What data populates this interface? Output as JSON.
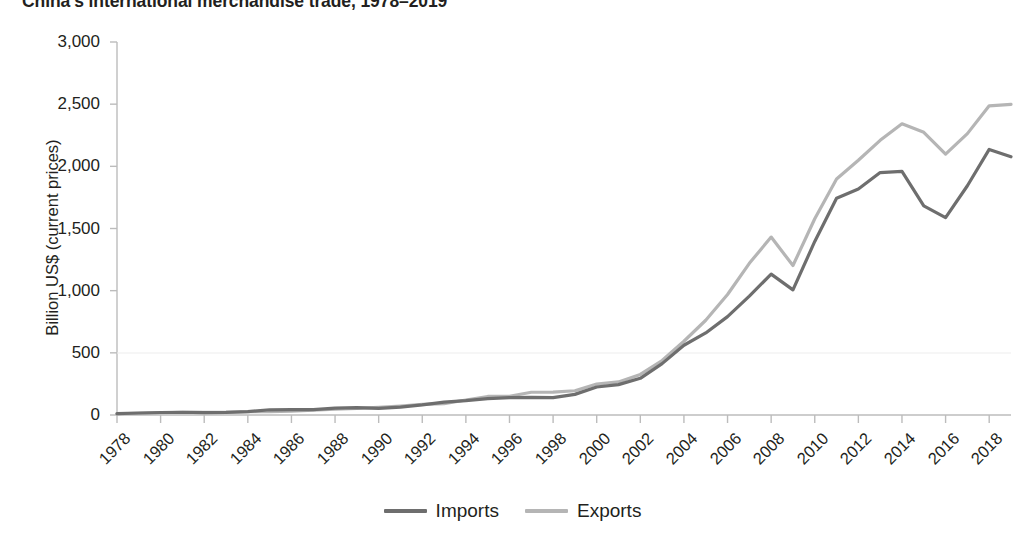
{
  "chart_data": {
    "type": "line",
    "title": "China's international merchandise trade, 1978–2019",
    "xlabel": "",
    "ylabel": "Billion US$ (current prices)",
    "ylim": [
      0,
      3000
    ],
    "xlim": [
      1978,
      2019
    ],
    "ytick_labels": [
      "0",
      "500",
      "1,000",
      "1,500",
      "2,000",
      "2,500",
      "3,000"
    ],
    "ytick_values": [
      0,
      500,
      1000,
      1500,
      2000,
      2500,
      3000
    ],
    "xtick_labels": [
      "1978",
      "1980",
      "1982",
      "1984",
      "1986",
      "1988",
      "1990",
      "1992",
      "1994",
      "1996",
      "1998",
      "2000",
      "2002",
      "2004",
      "2006",
      "2008",
      "2010",
      "2012",
      "2014",
      "2016",
      "2018"
    ],
    "xtick_values": [
      1978,
      1980,
      1982,
      1984,
      1986,
      1988,
      1990,
      1992,
      1994,
      1996,
      1998,
      2000,
      2002,
      2004,
      2006,
      2008,
      2010,
      2012,
      2014,
      2016,
      2018
    ],
    "x": [
      1978,
      1979,
      1980,
      1981,
      1982,
      1983,
      1984,
      1985,
      1986,
      1987,
      1988,
      1989,
      1990,
      1991,
      1992,
      1993,
      1994,
      1995,
      1996,
      1997,
      1998,
      1999,
      2000,
      2001,
      2002,
      2003,
      2004,
      2005,
      2006,
      2007,
      2008,
      2009,
      2010,
      2011,
      2012,
      2013,
      2014,
      2015,
      2016,
      2017,
      2018,
      2019
    ],
    "grid": false,
    "legend_position": "bottom-center",
    "series": [
      {
        "name": "Imports",
        "color": "#6e6e6e",
        "values": [
          11,
          16,
          20,
          22,
          19,
          21,
          27,
          42,
          43,
          43,
          55,
          59,
          53,
          64,
          81,
          104,
          116,
          132,
          139,
          142,
          140,
          166,
          225,
          244,
          295,
          413,
          561,
          660,
          791,
          956,
          1133,
          1006,
          1396,
          1743,
          1818,
          1950,
          1959,
          1682,
          1588,
          1844,
          2136,
          2077
        ]
      },
      {
        "name": "Exports",
        "color": "#b5b5b5",
        "values": [
          10,
          14,
          18,
          22,
          22,
          22,
          26,
          27,
          31,
          39,
          48,
          53,
          62,
          72,
          85,
          92,
          121,
          149,
          151,
          183,
          184,
          195,
          249,
          266,
          326,
          438,
          593,
          762,
          969,
          1220,
          1431,
          1202,
          1578,
          1898,
          2049,
          2209,
          2342,
          2274,
          2098,
          2263,
          2487,
          2499
        ]
      }
    ]
  },
  "legend": {
    "items": [
      {
        "label": "Imports",
        "color": "#6e6e6e"
      },
      {
        "label": "Exports",
        "color": "#b5b5b5"
      }
    ]
  },
  "axes": {
    "axis_color": "#bcbcbc"
  }
}
